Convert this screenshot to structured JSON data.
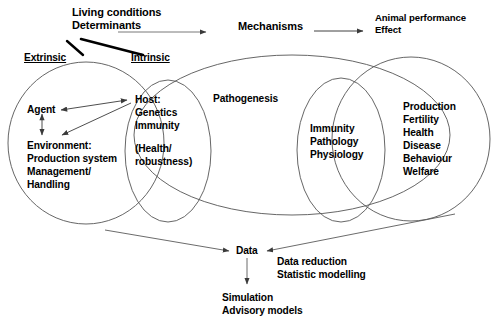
{
  "diagram": {
    "top_flow": {
      "source_line1": "Living conditions",
      "source_line2": "Determinants",
      "middle": "Mechanisms",
      "target_line1": "Animal performance",
      "target_line2": "Effect"
    },
    "determinant_types": {
      "extrinsic": "Extrinsic",
      "intrinsic": "Intrinsic"
    },
    "left_circle": {
      "agent": "Agent",
      "environment_line1": "Environment:",
      "environment_line2": "Production system",
      "environment_line3": "Management/",
      "environment_line4": "Handling"
    },
    "host_circle": {
      "line1": "Host:",
      "line2": "Genetics",
      "line3": "Immunity",
      "line4": "(Health/",
      "line5": "robustness)"
    },
    "center_ellipse": {
      "label": "Pathogenesis"
    },
    "mechanism_circle": {
      "line1": "Immunity",
      "line2": "Pathology",
      "line3": "Physiology"
    },
    "outcome_circle": {
      "items": [
        "Production",
        "Fertility",
        "Health",
        "Disease",
        "Behaviour",
        "Welfare"
      ]
    },
    "data_flow": {
      "data": "Data",
      "method_line1": "Data reduction",
      "method_line2": "Statistic modelling",
      "output_line1": "Simulation",
      "output_line2": "Advisory models"
    },
    "colors": {
      "stroke": "#4d4d4d",
      "thick_stroke": "#000000",
      "text": "#000000",
      "background": "#ffffff"
    }
  }
}
